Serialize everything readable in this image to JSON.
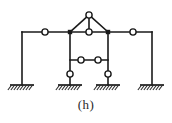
{
  "figure": {
    "caption": "(h)",
    "caption_x": 0,
    "caption_y": 97,
    "caption_font_size": 13,
    "width": 172,
    "height": 123,
    "background_color": "#ffffff",
    "line_color": "#1a1a1a",
    "hinge_fill_color": "#ffffff",
    "hatch_color": "#2b2b2b",
    "type": "structural-frame-diagram"
  },
  "geometry": {
    "top_beam_y": 32,
    "middle_beam_y": 60,
    "apex_y": 15,
    "base_y": 85,
    "columns_x": [
      22,
      70,
      108,
      152
    ],
    "apex_x": 89,
    "beam_left_end_x": 22,
    "beam_right_end_x": 152
  },
  "members": [
    {
      "name": "outer-left-column",
      "x1": 22,
      "y1": 32,
      "x2": 22,
      "y2": 85
    },
    {
      "name": "outer-right-column",
      "x1": 152,
      "y1": 32,
      "x2": 152,
      "y2": 85
    },
    {
      "name": "inner-left-column",
      "x1": 70,
      "y1": 32,
      "x2": 70,
      "y2": 85
    },
    {
      "name": "inner-right-column",
      "x1": 108,
      "y1": 32,
      "x2": 108,
      "y2": 85
    },
    {
      "name": "top-beam-left-span",
      "x1": 22,
      "y1": 32,
      "x2": 70,
      "y2": 32
    },
    {
      "name": "top-beam-center-span",
      "x1": 70,
      "y1": 32,
      "x2": 108,
      "y2": 32
    },
    {
      "name": "top-beam-right-span",
      "x1": 108,
      "y1": 32,
      "x2": 152,
      "y2": 32
    },
    {
      "name": "truss-left-rafter",
      "x1": 70,
      "y1": 32,
      "x2": 89,
      "y2": 15
    },
    {
      "name": "truss-right-rafter",
      "x1": 108,
      "y1": 32,
      "x2": 89,
      "y2": 15
    },
    {
      "name": "truss-king-post",
      "x1": 89,
      "y1": 15,
      "x2": 89,
      "y2": 32
    },
    {
      "name": "middle-beam",
      "x1": 70,
      "y1": 60,
      "x2": 108,
      "y2": 60
    }
  ],
  "hinges": [
    {
      "name": "hinge-apex",
      "cx": 89,
      "cy": 15,
      "r": 3.1
    },
    {
      "name": "hinge-top-beam-left-midspan",
      "cx": 45,
      "cy": 32,
      "r": 3.1
    },
    {
      "name": "hinge-top-beam-right-midspan",
      "cx": 133,
      "cy": 32,
      "r": 3.1
    },
    {
      "name": "hinge-truss-base-center",
      "cx": 89,
      "cy": 32,
      "r": 3.1
    },
    {
      "name": "hinge-middle-beam-left",
      "cx": 81,
      "cy": 60,
      "r": 3.1
    },
    {
      "name": "hinge-middle-beam-right",
      "cx": 98,
      "cy": 60,
      "r": 3.1
    },
    {
      "name": "hinge-inner-left-column-base",
      "cx": 70,
      "cy": 74,
      "r": 3.1
    },
    {
      "name": "hinge-inner-right-column-base",
      "cx": 108,
      "cy": 74,
      "r": 3.1
    }
  ],
  "joints": [
    {
      "name": "joint-top-left-inner",
      "cx": 70,
      "cy": 32
    },
    {
      "name": "joint-top-right-inner",
      "cx": 108,
      "cy": 32
    }
  ],
  "supports": [
    {
      "name": "support-outer-left",
      "cx": 22,
      "y": 85,
      "half_width": 12,
      "type": "fixed"
    },
    {
      "name": "support-inner-left",
      "cx": 70,
      "y": 85,
      "half_width": 12,
      "type": "fixed"
    },
    {
      "name": "support-inner-right",
      "cx": 108,
      "y": 85,
      "half_width": 12,
      "type": "fixed"
    },
    {
      "name": "support-outer-right",
      "cx": 152,
      "y": 85,
      "half_width": 12,
      "type": "fixed"
    }
  ]
}
